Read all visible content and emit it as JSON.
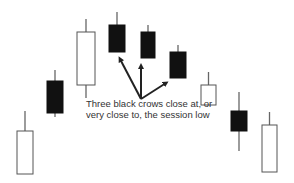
{
  "chart_data": {
    "type": "candlestick",
    "title": "",
    "xlabel": "",
    "ylabel": "",
    "grid": false,
    "legend": null,
    "pattern": "Three Black Crows",
    "candles": [
      {
        "index": 1,
        "color": "white",
        "wick_top": 111,
        "open": 174,
        "close": 131,
        "wick_bottom": 174
      },
      {
        "index": 2,
        "color": "black",
        "wick_top": 70,
        "open": 81,
        "close": 113,
        "wick_bottom": 117
      },
      {
        "index": 3,
        "color": "white",
        "wick_top": 19,
        "open": 85,
        "close": 32,
        "wick_bottom": 98
      },
      {
        "index": 4,
        "color": "black",
        "wick_top": 12,
        "open": 25,
        "close": 52,
        "wick_bottom": 52
      },
      {
        "index": 5,
        "color": "black",
        "wick_top": 25,
        "open": 32,
        "close": 58,
        "wick_bottom": 58
      },
      {
        "index": 6,
        "color": "black",
        "wick_top": 45,
        "open": 52,
        "close": 78,
        "wick_bottom": 78
      },
      {
        "index": 7,
        "color": "white",
        "wick_top": 72,
        "open": 105,
        "close": 85,
        "wick_bottom": 105
      },
      {
        "index": 8,
        "color": "black",
        "wick_top": 92,
        "open": 111,
        "close": 131,
        "wick_bottom": 151
      },
      {
        "index": 9,
        "color": "white",
        "wick_top": 112,
        "open": 172,
        "close": 125,
        "wick_bottom": 172
      }
    ],
    "annotations": [
      {
        "text_lines": [
          "Three black crows close at, or",
          "very close to, the session low"
        ],
        "points_to_candles": [
          4,
          5,
          6
        ]
      }
    ],
    "note": "values are pixel y-positions (no price axis shown); smaller = higher price"
  },
  "annotation": {
    "line1": "Three black crows close at, or",
    "line2": "very close to, the session low"
  },
  "colors": {
    "black_body": "#111111",
    "white_body": "#ffffff",
    "outline": "#555555",
    "wick": "#666666",
    "arrow": "#222222",
    "text": "#333333"
  }
}
